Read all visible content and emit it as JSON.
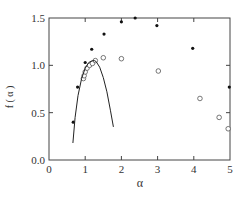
{
  "chart_data": {
    "type": "scatter",
    "title": "",
    "xlabel": "α",
    "ylabel": "f ( α )",
    "xlim": [
      0,
      5
    ],
    "ylim": [
      0.0,
      1.5
    ],
    "xticks": [
      "0",
      "1",
      "2",
      "3",
      "4",
      "5"
    ],
    "yticks": [
      "0.0",
      "0.5",
      "1.0",
      "1.5"
    ],
    "grid": false,
    "legend": null,
    "series": [
      {
        "name": "filled-dots",
        "marker": "filled-circle",
        "x": [
          0.67,
          0.79,
          1.0,
          1.18,
          1.52,
          2.0,
          2.38,
          2.98,
          3.97,
          4.98
        ],
        "y": [
          0.4,
          0.77,
          1.03,
          1.17,
          1.33,
          1.46,
          1.5,
          1.42,
          1.18,
          0.77
        ]
      },
      {
        "name": "open-circles",
        "marker": "open-circle",
        "x": [
          0.95,
          0.97,
          1.0,
          1.05,
          1.12,
          1.2,
          1.28,
          1.5,
          2.0,
          3.02,
          4.17,
          4.7,
          4.95
        ],
        "y": [
          0.86,
          0.89,
          0.93,
          0.97,
          1.0,
          1.02,
          1.05,
          1.08,
          1.07,
          0.94,
          0.65,
          0.45,
          0.33
        ]
      },
      {
        "name": "fitted-curve",
        "marker": "line",
        "x": [
          0.66,
          0.72,
          0.8,
          0.9,
          1.0,
          1.1,
          1.2,
          1.25,
          1.3,
          1.4,
          1.5,
          1.6,
          1.7,
          1.78
        ],
        "y": [
          0.18,
          0.45,
          0.68,
          0.86,
          0.97,
          1.03,
          1.05,
          1.05,
          1.04,
          0.98,
          0.87,
          0.72,
          0.52,
          0.35
        ]
      }
    ]
  }
}
